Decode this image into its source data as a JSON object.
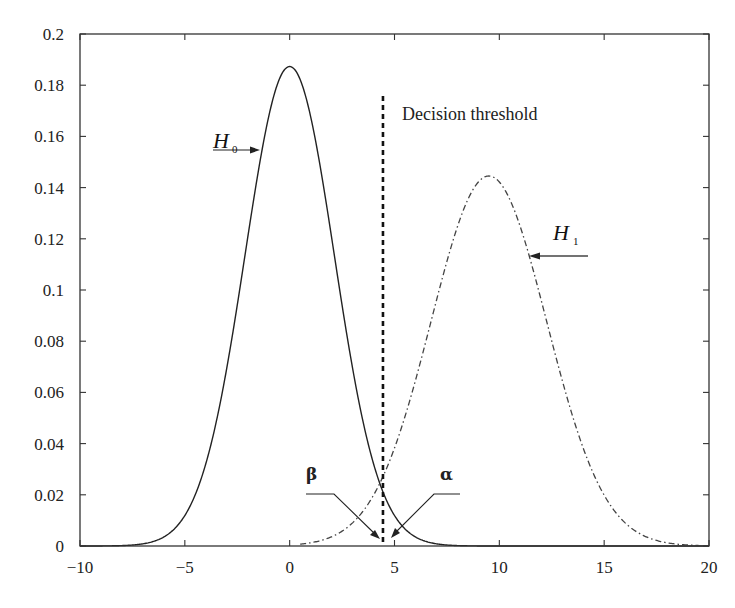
{
  "chart_data": {
    "type": "line",
    "title": "",
    "xlabel": "",
    "ylabel": "",
    "xlim": [
      -10,
      20
    ],
    "ylim": [
      0,
      0.2
    ],
    "grid": false,
    "x_ticks": [
      "-10",
      "-5",
      "0",
      "5",
      "10",
      "15",
      "20"
    ],
    "y_ticks": [
      "0",
      "0.02",
      "0.04",
      "0.06",
      "0.08",
      "0.1",
      "0.12",
      "0.14",
      "0.16",
      "0.18",
      "0.2"
    ],
    "series": [
      {
        "name": "H0",
        "style": "solid",
        "distribution": "gaussian",
        "mean": 0,
        "std": 2.13,
        "peak": 0.1875
      },
      {
        "name": "H1",
        "style": "dash-dot",
        "distribution": "gaussian",
        "mean": 9.5,
        "std": 2.76,
        "peak": 0.1445
      }
    ],
    "threshold": {
      "x": 4.45,
      "style": "dashed",
      "label": "Decision threshold"
    },
    "annotations": [
      {
        "text": "H0",
        "label_sub": "0",
        "points_to": "H0 curve left flank",
        "x": -1.3,
        "y": 0.163
      },
      {
        "text": "H1",
        "label_sub": "1",
        "points_to": "H1 curve right flank",
        "x": 11.5,
        "y": 0.114
      },
      {
        "text": "β",
        "points_to": "H1 tail left of threshold",
        "x": 4.3,
        "y": 0.0
      },
      {
        "text": "α",
        "points_to": "H0 tail right of threshold",
        "x": 4.9,
        "y": 0.0
      }
    ]
  },
  "labels": {
    "threshold": "Decision threshold",
    "h0_main": "H",
    "h0_sub": "0",
    "h1_main": "H",
    "h1_sub": "1",
    "beta": "β",
    "alpha": "α"
  },
  "colors": {
    "axis": "#333333",
    "h0_line": "#222222",
    "h1_line": "#444444",
    "threshold": "#111111"
  }
}
